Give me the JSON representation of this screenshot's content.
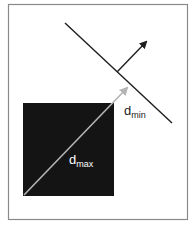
{
  "diagram": {
    "labels": {
      "d_min_base": "d",
      "d_min_sub": "min",
      "d_max_base": "d",
      "d_max_sub": "max"
    },
    "colors": {
      "frame": "#8a8a8a",
      "box": "#141414",
      "plane": "#1e1e1e",
      "normal_arrow": "#1e1e1e",
      "diagonal_arrow": "#b4b4b4",
      "label_on_dark": "#ffffff",
      "label_on_light": "#222222"
    }
  }
}
